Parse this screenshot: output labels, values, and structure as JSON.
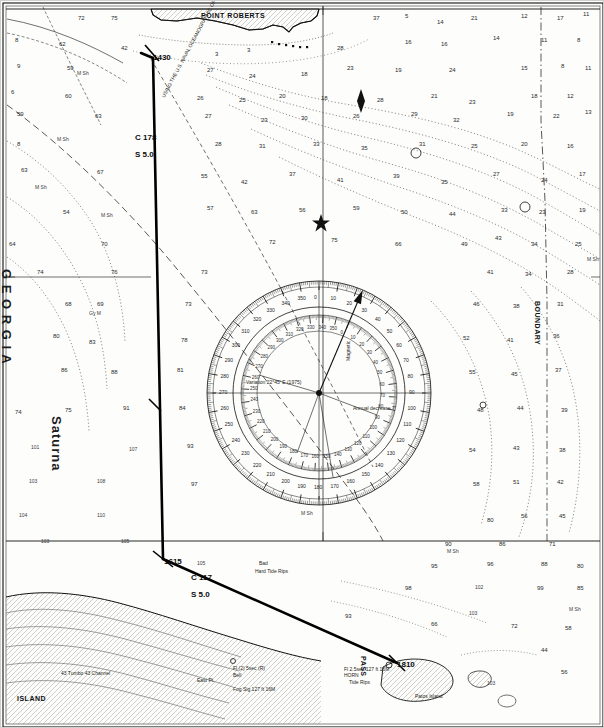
{
  "chart_data": {
    "type": "map",
    "subtitle": "Plotted course legs with compass rose",
    "grid": false,
    "legend": "none",
    "map_frame": {
      "width": 604,
      "height": 728
    },
    "named_features": [
      {
        "label": "POINT ROBERTS",
        "x": 200,
        "y": 11,
        "kind": "headland"
      },
      {
        "label": "G E O R G I A",
        "x": 12,
        "y": 268,
        "kind": "water-body",
        "style": "vertical"
      },
      {
        "label": "ISLAND",
        "x": 16,
        "y": 694,
        "kind": "island"
      },
      {
        "label": "East Pt.",
        "x": 196,
        "y": 677,
        "kind": "point"
      },
      {
        "label": "Patos Island",
        "x": 414,
        "y": 693,
        "kind": "island"
      },
      {
        "label": "PASS",
        "x": 366,
        "y": 655,
        "kind": "channel",
        "style": "vertical"
      },
      {
        "label": "Saturna",
        "x": 62,
        "y": 415,
        "kind": "island",
        "style": "vertical"
      },
      {
        "label": "BOUNDARY",
        "x": 540,
        "y": 300,
        "kind": "boundary",
        "style": "vertical"
      }
    ],
    "waypoints": [
      {
        "label": "1430",
        "x": 152,
        "y": 53,
        "kind": "fix-time"
      },
      {
        "label": "1615",
        "x": 163,
        "y": 557,
        "kind": "fix-time"
      },
      {
        "label": "1810",
        "x": 396,
        "y": 660,
        "kind": "fix-time"
      }
    ],
    "course_legs": [
      {
        "course_label": "C 178",
        "speed_label": "S 5.0",
        "lx": 134,
        "ly": 133,
        "sx": 134,
        "sy": 150,
        "from": [
          152,
          57
        ],
        "to": [
          162,
          558
        ]
      },
      {
        "course_label": "C 117",
        "speed_label": "S 5.0",
        "lx": 190,
        "ly": 573,
        "sx": 190,
        "sy": 590,
        "from": [
          162,
          558
        ],
        "to": [
          396,
          662
        ]
      }
    ],
    "chart_notes": [
      {
        "text": "USING THE U.S. NAVAL OCEANOGRAPHIC OFFICE PUB. 9 (H.O. 9) BOWDITCH",
        "x": 160,
        "y": 95,
        "rot": -62
      },
      {
        "text": "Magnetic",
        "x": 345,
        "y": 360,
        "rot": -90
      },
      {
        "text": "Variation 22°45' E (1975)",
        "x": 245,
        "y": 379,
        "rot": 0
      },
      {
        "text": "Annual decrease 7'",
        "x": 352,
        "y": 405,
        "rot": 0
      },
      {
        "text": "Bad",
        "x": 258,
        "y": 560,
        "rot": 0
      },
      {
        "text": "Hard Tide Rips",
        "x": 254,
        "y": 568,
        "rot": 0
      },
      {
        "text": "Fl 2.5sec 127 ft 16M",
        "x": 343,
        "y": 666,
        "rot": 0
      },
      {
        "text": "HORN",
        "x": 343,
        "y": 672,
        "rot": 0
      },
      {
        "text": "Tide Rips",
        "x": 348,
        "y": 679,
        "rot": 0
      },
      {
        "text": "Fl (2) 5sec (R)",
        "x": 232,
        "y": 665,
        "rot": 0
      },
      {
        "text": "Bell",
        "x": 232,
        "y": 672,
        "rot": 0
      },
      {
        "text": "43 Tumbo 43 Channel",
        "x": 60,
        "y": 670,
        "rot": 0
      },
      {
        "text": "Fog Sig 127 ft 16M",
        "x": 232,
        "y": 686,
        "rot": 0
      }
    ],
    "compass_rose": {
      "cx": 318,
      "cy": 392,
      "outer_r": 112,
      "inner_r": 78,
      "true_ticks": 360,
      "outer_labels": [
        0,
        10,
        20,
        30,
        40,
        50,
        60,
        70,
        80,
        90,
        100,
        110,
        120,
        130,
        140,
        150,
        160,
        170,
        180,
        190,
        200,
        210,
        220,
        230,
        240,
        250,
        260,
        270,
        280,
        290,
        300,
        310,
        320,
        330,
        340,
        350
      ],
      "inner_labels": [
        0,
        10,
        20,
        30,
        40,
        50,
        60,
        70,
        80,
        90,
        100,
        110,
        120,
        130,
        140,
        150,
        160,
        170,
        180,
        190,
        200,
        210,
        220,
        230,
        240,
        250,
        260,
        270,
        280,
        290,
        300,
        310,
        320,
        330,
        340,
        350
      ],
      "star_x": 320,
      "star_y": 222
    },
    "soundings": [
      {
        "v": "72",
        "x": 77,
        "y": 14
      },
      {
        "v": "75",
        "x": 110,
        "y": 14
      },
      {
        "v": "37",
        "x": 372,
        "y": 14
      },
      {
        "v": "5",
        "x": 404,
        "y": 12
      },
      {
        "v": "14",
        "x": 436,
        "y": 18
      },
      {
        "v": "21",
        "x": 470,
        "y": 14
      },
      {
        "v": "12",
        "x": 520,
        "y": 12
      },
      {
        "v": "17",
        "x": 556,
        "y": 14
      },
      {
        "v": "11",
        "x": 582,
        "y": 10
      },
      {
        "v": "8",
        "x": 14,
        "y": 36
      },
      {
        "v": "62",
        "x": 58,
        "y": 40
      },
      {
        "v": "42",
        "x": 120,
        "y": 44
      },
      {
        "v": "3",
        "x": 214,
        "y": 50
      },
      {
        "v": "3",
        "x": 246,
        "y": 46
      },
      {
        "v": "28",
        "x": 336,
        "y": 44
      },
      {
        "v": "16",
        "x": 404,
        "y": 38
      },
      {
        "v": "16",
        "x": 440,
        "y": 40
      },
      {
        "v": "14",
        "x": 492,
        "y": 34
      },
      {
        "v": "11",
        "x": 540,
        "y": 36
      },
      {
        "v": "8",
        "x": 576,
        "y": 36
      },
      {
        "v": "9",
        "x": 16,
        "y": 62
      },
      {
        "v": "59",
        "x": 66,
        "y": 64
      },
      {
        "v": "M Sh",
        "x": 76,
        "y": 70
      },
      {
        "v": "27",
        "x": 206,
        "y": 66
      },
      {
        "v": "24",
        "x": 248,
        "y": 72
      },
      {
        "v": "18",
        "x": 300,
        "y": 70
      },
      {
        "v": "23",
        "x": 346,
        "y": 64
      },
      {
        "v": "19",
        "x": 394,
        "y": 66
      },
      {
        "v": "24",
        "x": 448,
        "y": 66
      },
      {
        "v": "15",
        "x": 520,
        "y": 64
      },
      {
        "v": "8",
        "x": 560,
        "y": 62
      },
      {
        "v": "11",
        "x": 584,
        "y": 64
      },
      {
        "v": "6",
        "x": 10,
        "y": 88
      },
      {
        "v": "60",
        "x": 64,
        "y": 92
      },
      {
        "v": "26",
        "x": 196,
        "y": 94
      },
      {
        "v": "25",
        "x": 238,
        "y": 96
      },
      {
        "v": "20",
        "x": 278,
        "y": 92
      },
      {
        "v": "18",
        "x": 320,
        "y": 94
      },
      {
        "v": "28",
        "x": 376,
        "y": 96
      },
      {
        "v": "21",
        "x": 430,
        "y": 92
      },
      {
        "v": "23",
        "x": 468,
        "y": 98
      },
      {
        "v": "18",
        "x": 530,
        "y": 92
      },
      {
        "v": "12",
        "x": 566,
        "y": 92
      },
      {
        "v": "59",
        "x": 16,
        "y": 110
      },
      {
        "v": "63",
        "x": 94,
        "y": 112
      },
      {
        "v": "27",
        "x": 204,
        "y": 112
      },
      {
        "v": "23",
        "x": 260,
        "y": 116
      },
      {
        "v": "30",
        "x": 300,
        "y": 114
      },
      {
        "v": "26",
        "x": 352,
        "y": 112
      },
      {
        "v": "29",
        "x": 410,
        "y": 110
      },
      {
        "v": "32",
        "x": 452,
        "y": 116
      },
      {
        "v": "19",
        "x": 506,
        "y": 110
      },
      {
        "v": "22",
        "x": 552,
        "y": 112
      },
      {
        "v": "13",
        "x": 584,
        "y": 108
      },
      {
        "v": "8",
        "x": 16,
        "y": 140
      },
      {
        "v": "M Sh",
        "x": 56,
        "y": 136
      },
      {
        "v": "28",
        "x": 214,
        "y": 140
      },
      {
        "v": "31",
        "x": 258,
        "y": 142
      },
      {
        "v": "33",
        "x": 312,
        "y": 140
      },
      {
        "v": "35",
        "x": 360,
        "y": 144
      },
      {
        "v": "31",
        "x": 418,
        "y": 140
      },
      {
        "v": "25",
        "x": 470,
        "y": 142
      },
      {
        "v": "20",
        "x": 520,
        "y": 140
      },
      {
        "v": "16",
        "x": 566,
        "y": 142
      },
      {
        "v": "63",
        "x": 20,
        "y": 166
      },
      {
        "v": "M Sh",
        "x": 34,
        "y": 184
      },
      {
        "v": "67",
        "x": 96,
        "y": 168
      },
      {
        "v": "55",
        "x": 200,
        "y": 172
      },
      {
        "v": "42",
        "x": 240,
        "y": 178
      },
      {
        "v": "37",
        "x": 288,
        "y": 170
      },
      {
        "v": "41",
        "x": 336,
        "y": 176
      },
      {
        "v": "39",
        "x": 392,
        "y": 172
      },
      {
        "v": "35",
        "x": 440,
        "y": 178
      },
      {
        "v": "27",
        "x": 492,
        "y": 170
      },
      {
        "v": "24",
        "x": 540,
        "y": 176
      },
      {
        "v": "17",
        "x": 578,
        "y": 170
      },
      {
        "v": "54",
        "x": 62,
        "y": 208
      },
      {
        "v": "M Sh",
        "x": 100,
        "y": 212
      },
      {
        "v": "57",
        "x": 206,
        "y": 204
      },
      {
        "v": "63",
        "x": 250,
        "y": 208
      },
      {
        "v": "56",
        "x": 298,
        "y": 206
      },
      {
        "v": "59",
        "x": 352,
        "y": 204
      },
      {
        "v": "50",
        "x": 400,
        "y": 208
      },
      {
        "v": "44",
        "x": 448,
        "y": 210
      },
      {
        "v": "33",
        "x": 500,
        "y": 206
      },
      {
        "v": "23",
        "x": 538,
        "y": 208
      },
      {
        "v": "19",
        "x": 578,
        "y": 206
      },
      {
        "v": "64",
        "x": 8,
        "y": 240
      },
      {
        "v": "70",
        "x": 100,
        "y": 240
      },
      {
        "v": "72",
        "x": 268,
        "y": 238
      },
      {
        "v": "75",
        "x": 330,
        "y": 236
      },
      {
        "v": "66",
        "x": 394,
        "y": 240
      },
      {
        "v": "49",
        "x": 460,
        "y": 240
      },
      {
        "v": "43",
        "x": 494,
        "y": 234
      },
      {
        "v": "34",
        "x": 530,
        "y": 240
      },
      {
        "v": "25",
        "x": 574,
        "y": 240
      },
      {
        "v": "M Sh",
        "x": 586,
        "y": 256
      },
      {
        "v": "74",
        "x": 36,
        "y": 268
      },
      {
        "v": "76",
        "x": 110,
        "y": 268
      },
      {
        "v": "73",
        "x": 200,
        "y": 268
      },
      {
        "v": "41",
        "x": 486,
        "y": 268
      },
      {
        "v": "34",
        "x": 524,
        "y": 270
      },
      {
        "v": "28",
        "x": 566,
        "y": 268
      },
      {
        "v": "68",
        "x": 64,
        "y": 300
      },
      {
        "v": "69",
        "x": 96,
        "y": 300
      },
      {
        "v": "73",
        "x": 184,
        "y": 300
      },
      {
        "v": "46",
        "x": 472,
        "y": 300
      },
      {
        "v": "38",
        "x": 512,
        "y": 302
      },
      {
        "v": "31",
        "x": 556,
        "y": 300
      },
      {
        "v": "Gy M",
        "x": 88,
        "y": 310
      },
      {
        "v": "80",
        "x": 52,
        "y": 332
      },
      {
        "v": "83",
        "x": 88,
        "y": 338
      },
      {
        "v": "78",
        "x": 180,
        "y": 336
      },
      {
        "v": "52",
        "x": 462,
        "y": 334
      },
      {
        "v": "41",
        "x": 506,
        "y": 336
      },
      {
        "v": "36",
        "x": 552,
        "y": 332
      },
      {
        "v": "86",
        "x": 60,
        "y": 366
      },
      {
        "v": "88",
        "x": 110,
        "y": 368
      },
      {
        "v": "81",
        "x": 176,
        "y": 366
      },
      {
        "v": "55",
        "x": 468,
        "y": 368
      },
      {
        "v": "45",
        "x": 510,
        "y": 370
      },
      {
        "v": "37",
        "x": 554,
        "y": 366
      },
      {
        "v": "74",
        "x": 14,
        "y": 408
      },
      {
        "v": "75",
        "x": 64,
        "y": 406
      },
      {
        "v": "91",
        "x": 122,
        "y": 404
      },
      {
        "v": "84",
        "x": 178,
        "y": 404
      },
      {
        "v": "48",
        "x": 476,
        "y": 406
      },
      {
        "v": "44",
        "x": 516,
        "y": 404
      },
      {
        "v": "39",
        "x": 560,
        "y": 406
      },
      {
        "v": "101",
        "x": 30,
        "y": 444
      },
      {
        "v": "107",
        "x": 128,
        "y": 446
      },
      {
        "v": "93",
        "x": 186,
        "y": 442
      },
      {
        "v": "54",
        "x": 468,
        "y": 446
      },
      {
        "v": "43",
        "x": 512,
        "y": 444
      },
      {
        "v": "38",
        "x": 558,
        "y": 446
      },
      {
        "v": "103",
        "x": 28,
        "y": 478
      },
      {
        "v": "108",
        "x": 96,
        "y": 478
      },
      {
        "v": "97",
        "x": 190,
        "y": 480
      },
      {
        "v": "58",
        "x": 472,
        "y": 480
      },
      {
        "v": "51",
        "x": 512,
        "y": 478
      },
      {
        "v": "42",
        "x": 556,
        "y": 478
      },
      {
        "v": "104",
        "x": 18,
        "y": 512
      },
      {
        "v": "110",
        "x": 96,
        "y": 512
      },
      {
        "v": "M Sh",
        "x": 300,
        "y": 510
      },
      {
        "v": "80",
        "x": 486,
        "y": 516
      },
      {
        "v": "56",
        "x": 520,
        "y": 512
      },
      {
        "v": "45",
        "x": 558,
        "y": 512
      },
      {
        "v": "103",
        "x": 40,
        "y": 538
      },
      {
        "v": "105",
        "x": 120,
        "y": 538
      },
      {
        "v": "90",
        "x": 444,
        "y": 540
      },
      {
        "v": "M Sh",
        "x": 446,
        "y": 548
      },
      {
        "v": "86",
        "x": 498,
        "y": 540
      },
      {
        "v": "71",
        "x": 548,
        "y": 540
      },
      {
        "v": "105",
        "x": 196,
        "y": 560
      },
      {
        "v": "95",
        "x": 430,
        "y": 562
      },
      {
        "v": "96",
        "x": 486,
        "y": 560
      },
      {
        "v": "88",
        "x": 540,
        "y": 560
      },
      {
        "v": "80",
        "x": 576,
        "y": 562
      },
      {
        "v": "98",
        "x": 404,
        "y": 584
      },
      {
        "v": "102",
        "x": 474,
        "y": 584
      },
      {
        "v": "99",
        "x": 536,
        "y": 584
      },
      {
        "v": "85",
        "x": 576,
        "y": 584
      },
      {
        "v": "93",
        "x": 344,
        "y": 612
      },
      {
        "v": "103",
        "x": 468,
        "y": 610
      },
      {
        "v": "M Sh",
        "x": 568,
        "y": 606
      },
      {
        "v": "66",
        "x": 430,
        "y": 620
      },
      {
        "v": "72",
        "x": 510,
        "y": 622
      },
      {
        "v": "58",
        "x": 564,
        "y": 624
      },
      {
        "v": "103",
        "x": 486,
        "y": 680
      },
      {
        "v": "44",
        "x": 540,
        "y": 646
      },
      {
        "v": "56",
        "x": 560,
        "y": 668
      }
    ]
  },
  "title_info": {
    "caption": "Nautical chart with plotted course"
  }
}
